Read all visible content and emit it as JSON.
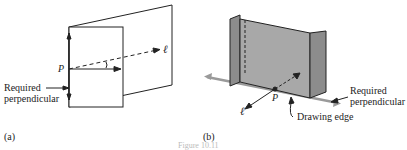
{
  "figure": {
    "caption": "Figure 10.11",
    "panel_a": {
      "label": "(a)",
      "point_label": "P",
      "line_label": "ℓ",
      "annotation": [
        "Required",
        "perpendicular"
      ]
    },
    "panel_b": {
      "label": "(b)",
      "point_label": "P",
      "line_label": "ℓ",
      "annotation": [
        "Required",
        "perpendicular"
      ],
      "edge_label": "Drawing edge"
    },
    "colors": {
      "line": "#222222",
      "plane_fill": "#a8a8a8",
      "plane_dark": "#8c8c8c",
      "arrow_gray": "#9a9a9a"
    }
  }
}
